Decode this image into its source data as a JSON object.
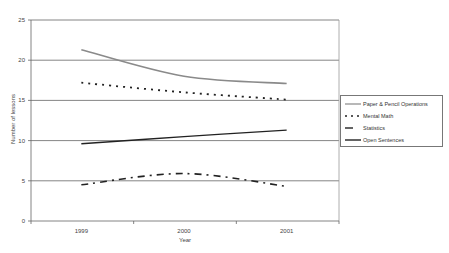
{
  "chart_data": {
    "type": "line",
    "title": "",
    "xlabel": "Year",
    "ylabel": "Number of lessons",
    "categories": [
      "1999",
      "2000",
      "2001"
    ],
    "ylim": [
      0,
      25
    ],
    "yticks": [
      "0",
      "5",
      "10",
      "15",
      "20",
      "25"
    ],
    "grid": true,
    "legend_position": "right",
    "series": [
      {
        "name": "Paper & Pencil Operations",
        "values": [
          21.3,
          18.0,
          17.1
        ],
        "style": "solid-gray",
        "color": "#888888"
      },
      {
        "name": "Mental Math",
        "values": [
          17.2,
          16.0,
          15.1
        ],
        "style": "dotted",
        "color": "#222222"
      },
      {
        "name": "Statistics",
        "values": [
          4.5,
          5.9,
          4.3
        ],
        "style": "dash-dot",
        "color": "#222222"
      },
      {
        "name": "Open Sentences",
        "values": [
          9.6,
          10.5,
          11.3
        ],
        "style": "solid-dark",
        "color": "#222222"
      }
    ]
  },
  "legend": {
    "items": [
      {
        "label": "Paper & Pencil Operations"
      },
      {
        "label": "Mental Math"
      },
      {
        "label": "Statistics"
      },
      {
        "label": "Open Sentences"
      }
    ]
  }
}
